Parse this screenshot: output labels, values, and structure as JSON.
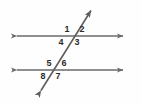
{
  "figure": {
    "background_color": "#fefefe",
    "line_color": "#6a6a6a",
    "label_color": "#2b2b2b",
    "width": 141,
    "height": 105,
    "lines": [
      {
        "name": "top-parallel-line",
        "kind": "horizontal-parallel",
        "x1": 11,
        "y1": 36,
        "x2": 129,
        "y2": 36,
        "arrow_start": true,
        "arrow_end": true
      },
      {
        "name": "bottom-parallel-line",
        "kind": "horizontal-parallel",
        "x1": 11,
        "y1": 70,
        "x2": 129,
        "y2": 70,
        "arrow_start": true,
        "arrow_end": true
      },
      {
        "name": "transversal-line",
        "kind": "transversal",
        "x1": 37,
        "y1": 97,
        "x2": 95,
        "y2": 4,
        "arrow_start": true,
        "arrow_end": true
      }
    ],
    "intersections": [
      {
        "name": "upper-intersection",
        "x": 72,
        "y": 36
      },
      {
        "name": "lower-intersection",
        "x": 54,
        "y": 70
      }
    ],
    "angle_labels": [
      {
        "id": "angle-1",
        "text": "1",
        "x": 62,
        "y": 25,
        "position": "upper-left-of-upper-intersection"
      },
      {
        "id": "angle-2",
        "text": "2",
        "x": 77,
        "y": 25,
        "position": "upper-right-of-upper-intersection"
      },
      {
        "id": "angle-3",
        "text": "3",
        "x": 72,
        "y": 38,
        "position": "lower-right-of-upper-intersection"
      },
      {
        "id": "angle-4",
        "text": "4",
        "x": 56,
        "y": 38,
        "position": "lower-left-of-upper-intersection"
      },
      {
        "id": "angle-5",
        "text": "5",
        "x": 44,
        "y": 59,
        "position": "upper-left-of-lower-intersection"
      },
      {
        "id": "angle-6",
        "text": "6",
        "x": 59,
        "y": 59,
        "position": "upper-right-of-lower-intersection"
      },
      {
        "id": "angle-7",
        "text": "7",
        "x": 53,
        "y": 72,
        "position": "lower-right-of-lower-intersection"
      },
      {
        "id": "angle-8",
        "text": "8",
        "x": 38,
        "y": 72,
        "position": "lower-left-of-lower-intersection"
      }
    ]
  }
}
